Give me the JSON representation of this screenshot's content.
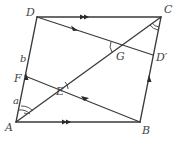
{
  "diagram": {
    "type": "parallelogram-geometry",
    "labels": {
      "A": "A",
      "B": "B",
      "C": "C",
      "D": "D",
      "E": "E",
      "F": "F",
      "G": "G",
      "Dprime": "D′",
      "a": "a",
      "b": "b"
    },
    "points": {
      "A": [
        16,
        122
      ],
      "B": [
        140,
        122
      ],
      "C": [
        161,
        17
      ],
      "D": [
        37,
        17
      ],
      "F": [
        25,
        76
      ],
      "E": [
        62,
        85
      ],
      "G": [
        121,
        45
      ],
      "Dprime": [
        153,
        55
      ]
    },
    "segments": [
      "AB",
      "BC",
      "CD",
      "DA",
      "AC",
      "DD'",
      "FD'?"
    ],
    "colors": {
      "stroke": "#3a3a3a",
      "label": "#444444",
      "background": "#ffffff"
    }
  }
}
